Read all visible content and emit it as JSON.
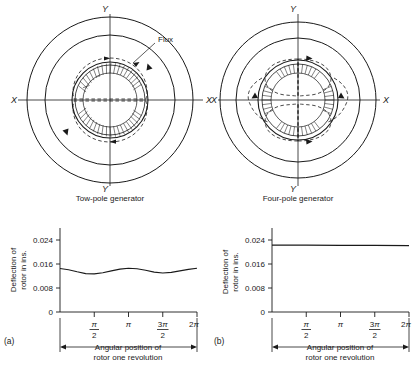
{
  "figure": {
    "type": "technical-illustration"
  },
  "diagrams": [
    {
      "id": "two-pole",
      "caption": "Tow-pole generator",
      "axis_labels": {
        "vertical_top": "Y",
        "vertical_bottom": "Y",
        "horizontal_left": "X",
        "horizontal_right": "X"
      },
      "annotation": {
        "label": "Flux"
      },
      "pole_count": 2,
      "flux_loops": 2
    },
    {
      "id": "four-pole",
      "caption": "Four-pole generator",
      "axis_labels": {
        "vertical_top": "Y",
        "vertical_bottom": "Y",
        "horizontal_left": "X",
        "horizontal_right": "X"
      },
      "pole_count": 4,
      "flux_loops": 4
    }
  ],
  "panel_labels": {
    "left": "(a)",
    "right": "(b)"
  },
  "chart_data": [
    {
      "type": "line",
      "id": "chart-a",
      "title": "",
      "xlabel": "Angular position of rotor one revolution",
      "ylabel": "Deflection of rotor in ins.",
      "ylim": [
        0,
        0.028
      ],
      "yticks": [
        0,
        0.008,
        0.016,
        0.024
      ],
      "ytick_labels": [
        "0",
        "0.008",
        "0.016",
        "0.024"
      ],
      "xlim": [
        0,
        6.2832
      ],
      "xticks": [
        1.5708,
        3.1416,
        4.7124,
        6.2832
      ],
      "xtick_labels": [
        "π/2",
        "π",
        "3π/2",
        "2π"
      ],
      "grid": false,
      "legend": "none",
      "x": [
        0,
        0.3927,
        0.7854,
        1.1781,
        1.5708,
        1.9635,
        2.3562,
        2.7489,
        3.1416,
        3.5343,
        3.927,
        4.3197,
        4.7124,
        5.1051,
        5.4978,
        5.8905,
        6.2832
      ],
      "values": [
        0.0145,
        0.0141,
        0.0134,
        0.0128,
        0.0127,
        0.0131,
        0.0137,
        0.0143,
        0.0146,
        0.0144,
        0.0139,
        0.0133,
        0.013,
        0.0132,
        0.0137,
        0.0142,
        0.0146
      ]
    },
    {
      "type": "line",
      "id": "chart-b",
      "title": "",
      "xlabel": "Angular position of rotor one revolution",
      "ylabel": "Deflection of rotor in ins.",
      "ylim": [
        0,
        0.028
      ],
      "yticks": [
        0,
        0.008,
        0.016,
        0.024
      ],
      "ytick_labels": [
        "0",
        "0.008",
        "0.016",
        "0.024"
      ],
      "xlim": [
        0,
        6.2832
      ],
      "xticks": [
        1.5708,
        3.1416,
        4.7124,
        6.2832
      ],
      "xtick_labels": [
        "π/2",
        "π",
        "3π/2",
        "2π"
      ],
      "grid": false,
      "legend": "none",
      "x": [
        0,
        1.5708,
        3.1416,
        4.7124,
        6.2832
      ],
      "values": [
        0.0223,
        0.0223,
        0.0222,
        0.0222,
        0.0221
      ]
    }
  ],
  "axis_text": {
    "ylabel_line1": "Deflection of",
    "ylabel_line2": "rotor in ins.",
    "xlabel_line1": "Angular position of",
    "xlabel_line2": "rotor one revolution"
  },
  "colors": {
    "ink": "#1a1a1a",
    "background": "#ffffff"
  }
}
